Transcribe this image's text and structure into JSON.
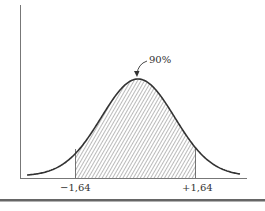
{
  "chart_data": {
    "type": "area",
    "title": "",
    "annotations": [
      {
        "text": "90%",
        "points_to": "shaded central area"
      }
    ],
    "x_tick_labels": [
      "−1,64",
      "+1,64"
    ],
    "shaded_range": [
      -1.64,
      1.64
    ],
    "shaded_area_percent": 90,
    "xlabel": "",
    "ylabel": "",
    "grid": false,
    "legend": null
  },
  "labels": {
    "annotation": "90%",
    "left_tick": "−1,64",
    "right_tick": "+1,64"
  },
  "colors": {
    "line": "#333333",
    "axis": "#666666",
    "hatch": "#555555"
  }
}
